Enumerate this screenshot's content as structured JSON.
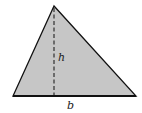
{
  "diagram": {
    "shape": "triangle",
    "vertices": {
      "apex": [
        54,
        6
      ],
      "bottom_left": [
        13,
        96
      ],
      "bottom_right": [
        136,
        96
      ]
    },
    "fill_color": "#c6c6c6",
    "stroke_color": "#111111",
    "altitude": {
      "style": "dashed",
      "from": [
        54,
        8
      ],
      "to": [
        54,
        95
      ]
    },
    "labels": {
      "height": "h",
      "base": "b"
    }
  }
}
